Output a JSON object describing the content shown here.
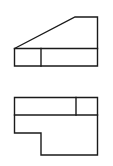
{
  "diagram": {
    "type": "orthographic-projection",
    "stroke_color": "#1a1a1a",
    "background": "#ffffff",
    "views": [
      {
        "name": "upper-view",
        "outline": [
          [
            14.5,
            48.5
          ],
          [
            75,
            17
          ],
          [
            97.5,
            17
          ],
          [
            97.5,
            66
          ],
          [
            14.5,
            66
          ]
        ],
        "lines": [
          [
            [
              14.5,
              48.5
            ],
            [
              97.5,
              48.5
            ]
          ],
          [
            [
              41,
              48.5
            ],
            [
              41,
              66
            ]
          ]
        ]
      },
      {
        "name": "lower-view",
        "outline": [
          [
            14.5,
            97.5
          ],
          [
            97.5,
            97.5
          ],
          [
            97.5,
            155
          ],
          [
            41,
            155
          ],
          [
            41,
            133
          ],
          [
            14.5,
            133
          ]
        ],
        "lines": [
          [
            [
              14.5,
              115
            ],
            [
              97.5,
              115
            ]
          ],
          [
            [
              76,
              97.5
            ],
            [
              76,
              115
            ]
          ]
        ]
      }
    ]
  }
}
